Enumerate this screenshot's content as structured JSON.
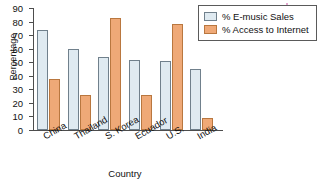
{
  "chart_data": {
    "type": "bar",
    "title": "",
    "xlabel": "Country",
    "ylabel": "Percentage",
    "ylim": [
      0,
      90
    ],
    "ytick_step": 10,
    "yticks": [
      0,
      10,
      20,
      30,
      40,
      50,
      60,
      70,
      80,
      90
    ],
    "grid": false,
    "legend_position": "top-right",
    "categories": [
      "China",
      "Thailand",
      "S. Korea",
      "Ecuador",
      "U.S.",
      "India"
    ],
    "series": [
      {
        "name": "% E-music Sales",
        "color": "#dfeaf1",
        "border": "#70808c",
        "values": [
          74,
          60,
          54,
          52,
          51,
          45
        ]
      },
      {
        "name": "% Access to Internet",
        "color": "#efa977",
        "border": "#b9773f",
        "values": [
          38,
          26,
          83,
          26,
          78,
          9
        ]
      }
    ]
  },
  "axes": {
    "y_title": "Percentage",
    "x_title": "Country"
  },
  "legend": {
    "entries": [
      {
        "label": "% E-music Sales",
        "swatch": "blue-swatch-icon"
      },
      {
        "label": "% Access to Internet",
        "swatch": "orange-swatch-icon"
      }
    ]
  },
  "colors": {
    "series_blue": "#dfeaf1",
    "series_blue_border": "#70808c",
    "series_orange": "#efa977",
    "series_orange_border": "#b9773f",
    "axis": "#4d4d4d",
    "text": "#111111",
    "background": "#ffffff"
  }
}
